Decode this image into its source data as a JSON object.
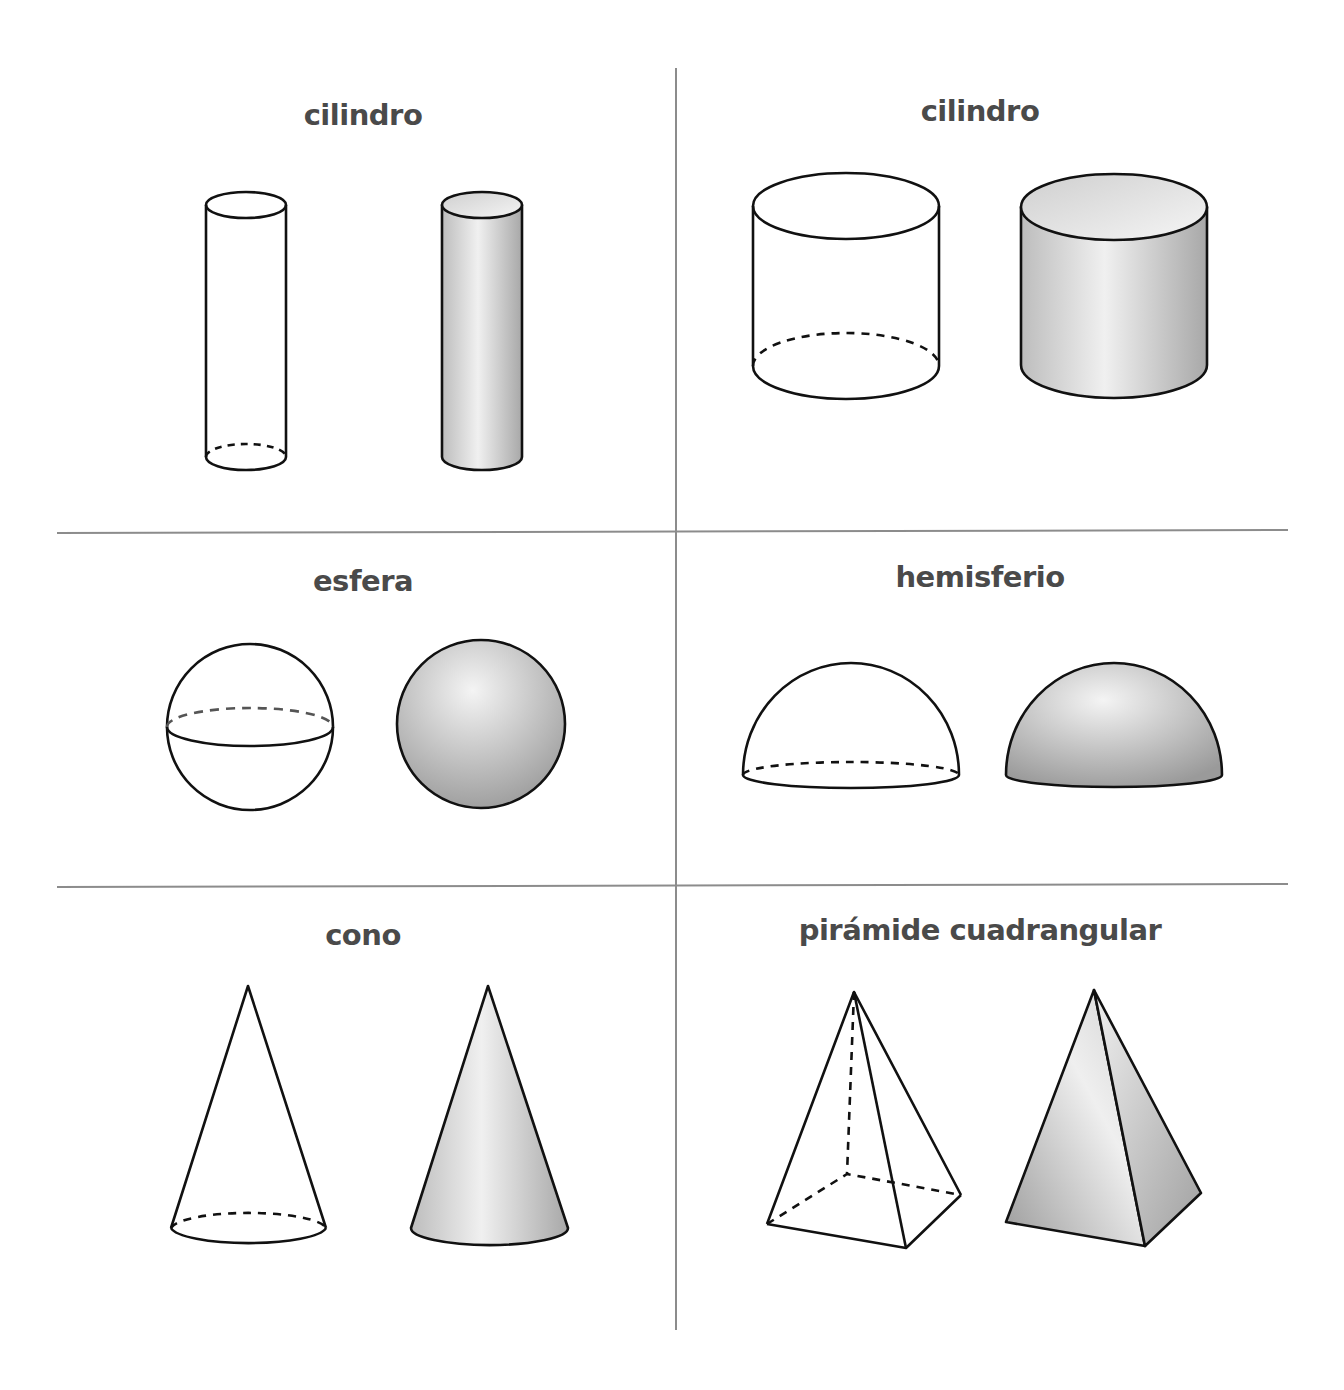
{
  "cells": [
    {
      "id": "cylinder-tall",
      "label": "cilindro",
      "shapes": [
        "outline",
        "shaded"
      ]
    },
    {
      "id": "cylinder-wide",
      "label": "cilindro",
      "shapes": [
        "outline",
        "shaded"
      ]
    },
    {
      "id": "sphere",
      "label": "esfera",
      "shapes": [
        "outline",
        "shaded"
      ]
    },
    {
      "id": "hemisphere",
      "label": "hemisferio",
      "shapes": [
        "outline",
        "shaded"
      ]
    },
    {
      "id": "cone",
      "label": "cono",
      "shapes": [
        "outline",
        "shaded"
      ]
    },
    {
      "id": "square-pyramid",
      "label": "pirámide cuadrangular",
      "shapes": [
        "outline",
        "shaded"
      ]
    }
  ],
  "colors": {
    "stroke": "#111111",
    "divider": "#8c8c8c",
    "label": "#4a4a4a",
    "shade_dark": "#9a9a9a",
    "shade_light": "#f2f2f2"
  }
}
